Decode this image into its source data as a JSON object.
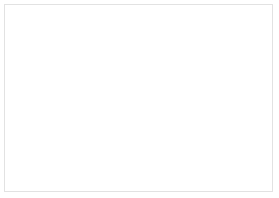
{
  "app": {
    "name": "3D Design Viewport",
    "view": "perspective"
  },
  "viewport": {
    "width": 279,
    "height": 198,
    "background_color": "#ffffff",
    "frame_border_color": "#e2e2e2"
  },
  "workplane": {
    "name": "grid-workplane",
    "grid_visible": true,
    "grid_line_color": "#cdcdcd",
    "grid_spacing_px": 11,
    "surface_color": "#fbfbfb"
  },
  "objects": [
    {
      "id": "ice-cube-cluster",
      "label": "Ice Cubes",
      "selected": true,
      "shape": "rounded-cubes-group",
      "count": 4,
      "fill_color": "#b4b4b4",
      "stroke_color": "#8a8a8a",
      "opacity": "translucent"
    },
    {
      "id": "drinking-glass",
      "label": "Glass",
      "selected": false,
      "shape": "tapered-cylinder",
      "body_color": "#dedede",
      "liquid_color": "#9a9a9a",
      "rim_color": "#f2f2f2",
      "opacity": "translucent"
    }
  ],
  "selection": {
    "active_object": "ice-cube-cluster",
    "handle_fill": "#ffffff",
    "handle_stroke": "#5e5e5e",
    "handles": [
      {
        "name": "lift-handle",
        "type": "height",
        "x": 33,
        "y": 2
      },
      {
        "name": "corner-handle-top",
        "type": "scale",
        "x": 31,
        "y": 20
      },
      {
        "name": "corner-handle-left",
        "type": "scale",
        "x": 13,
        "y": 50
      },
      {
        "name": "corner-handle-center",
        "type": "scale",
        "x": 49,
        "y": 50
      },
      {
        "name": "corner-handle-right",
        "type": "scale",
        "x": 80,
        "y": 50
      },
      {
        "name": "edge-handle-bl",
        "type": "scale",
        "x": 13,
        "y": 62
      },
      {
        "name": "edge-handle-b1",
        "type": "scale",
        "x": 44,
        "y": 68
      },
      {
        "name": "edge-handle-b2",
        "type": "scale",
        "x": 60,
        "y": 68
      },
      {
        "name": "rotate-handle-left",
        "type": "rotate",
        "x": 12,
        "y": 74
      },
      {
        "name": "rotate-handle-bottom",
        "type": "rotate",
        "x": 49,
        "y": 82
      }
    ]
  },
  "shadows": {
    "glass_shadow_color": "rgba(90,90,90,0.46)",
    "cubes_shadow_color": "rgba(95,95,95,0.40)"
  }
}
